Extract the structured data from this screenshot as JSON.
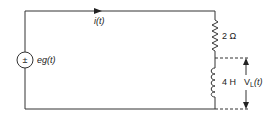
{
  "diagram": {
    "type": "series-RL-circuit",
    "source": {
      "symbol": "±",
      "label": "eg(t)"
    },
    "current": {
      "label": "i(t)"
    },
    "resistor": {
      "label": "2 Ω"
    },
    "inductor": {
      "label": "4 H"
    },
    "voltage": {
      "label_main": "V",
      "label_sub": "L",
      "label_tail": "(t)"
    }
  },
  "colors": {
    "wire": "#333333",
    "background": "#ffffff"
  }
}
